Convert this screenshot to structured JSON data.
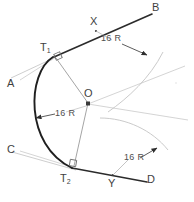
{
  "drawing": {
    "title": "Arc tangent to two lines construction",
    "radius_value": "16 R",
    "colors": {
      "arc": "#262626",
      "tangent_line": "#2e2e2e",
      "construction": "#b9b9b9",
      "radius_line": "#8c8c8c",
      "label": "#4a4a4a",
      "background": "#ffffff"
    },
    "points": {
      "A": {
        "label": "A",
        "x": 10,
        "y": 84
      },
      "B": {
        "label": "B",
        "x": 155,
        "y": 8
      },
      "C": {
        "label": "C",
        "x": 10,
        "y": 150
      },
      "D": {
        "label": "D",
        "x": 148,
        "y": 176
      },
      "X": {
        "label": "X",
        "x": 90,
        "y": 18
      },
      "Y": {
        "label": "Y",
        "x": 109,
        "y": 178
      },
      "O": {
        "label": "O",
        "x": 85,
        "y": 95
      },
      "T1": {
        "label": "T",
        "sub": "1",
        "x": 41,
        "y": 44
      },
      "T2": {
        "label": "T",
        "sub": "2",
        "x": 61,
        "y": 175
      }
    },
    "dimensions": [
      {
        "name": "radius-callout-top-right",
        "label": "16 R",
        "x": 105,
        "y": 38
      },
      {
        "name": "radius-callout-middle-left",
        "label": "16 R",
        "x": 43,
        "y": 110
      },
      {
        "name": "radius-callout-bottom-right",
        "label": "16 R",
        "x": 120,
        "y": 155
      }
    ],
    "geometry": {
      "center": {
        "x": 90,
        "y": 104
      },
      "radius": 56,
      "tangent_point_1": {
        "x": 52,
        "y": 58
      },
      "tangent_point_2": {
        "x": 73,
        "y": 169
      },
      "line_AB": {
        "x1": 11,
        "y1": 78,
        "x2": 152,
        "y2": 14
      },
      "line_CD": {
        "x1": 12,
        "y1": 152,
        "x2": 150,
        "y2": 180
      },
      "right_angle_markers": [
        {
          "x": 55,
          "y": 52,
          "rotation": -24
        },
        {
          "x": 72,
          "y": 162,
          "rotation": 12
        }
      ]
    }
  }
}
